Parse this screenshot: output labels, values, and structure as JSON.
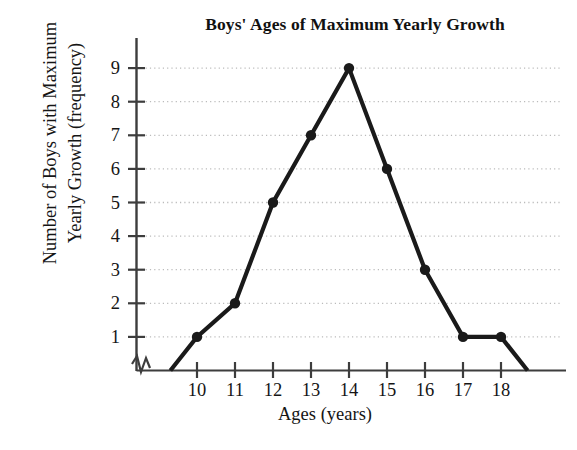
{
  "chart_data": {
    "type": "line",
    "title": "Boys' Ages of Maximum Yearly Growth",
    "xlabel": "Ages (years)",
    "ylabel_line1": "Number of Boys with Maximum",
    "ylabel_line2": "Yearly Growth (frequency)",
    "categories": [
      10,
      11,
      12,
      13,
      14,
      15,
      16,
      17,
      18
    ],
    "x_tick_labels": [
      "10",
      "11",
      "12",
      "13",
      "14",
      "15",
      "16",
      "17",
      "18"
    ],
    "values": [
      1,
      2,
      5,
      7,
      9,
      6,
      3,
      1,
      1
    ],
    "y_tick_labels": [
      "1",
      "2",
      "3",
      "4",
      "5",
      "6",
      "7",
      "8",
      "9"
    ],
    "y_ticks": [
      1,
      2,
      3,
      4,
      5,
      6,
      7,
      8,
      9
    ],
    "ylim": [
      0,
      9
    ],
    "xlim": [
      9,
      19
    ],
    "grid": "horizontal-dotted",
    "legend": "none",
    "markers": "filled-circle",
    "axis_break": "y-axis-origin-zigzag",
    "anchor_points": [
      {
        "x": 9.3,
        "y": 0
      },
      {
        "x": 18.7,
        "y": 0
      }
    ],
    "series_name": "Frequency",
    "line_color": "#1a1a1a",
    "grid_color": "#bbbbbb",
    "axis_color": "#4a4a4a",
    "background_color": "#ffffff"
  }
}
